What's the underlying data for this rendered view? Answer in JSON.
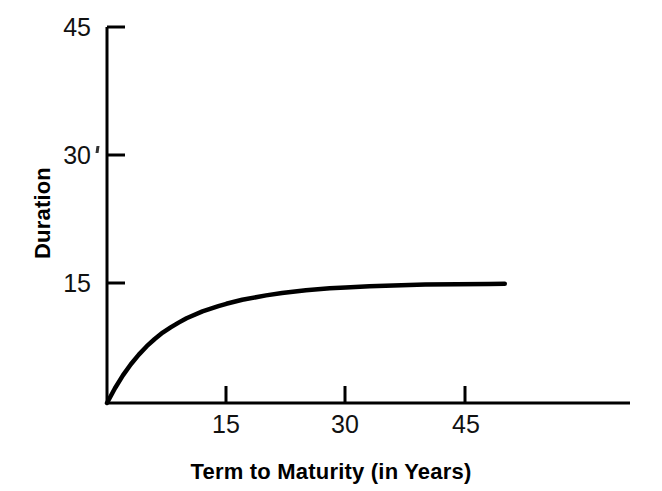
{
  "chart_data": {
    "type": "line",
    "title": "",
    "subtitle": "",
    "xlabel": "Term to Maturity (in Years)",
    "ylabel": "Duration",
    "xlim": [
      0,
      65
    ],
    "ylim": [
      0,
      47
    ],
    "xticks": [
      15,
      30,
      45
    ],
    "xtick_labels": [
      "15",
      "30",
      "45"
    ],
    "yticks": [
      15,
      30,
      45
    ],
    "ytick_labels": [
      "15",
      "30",
      "45"
    ],
    "grid": false,
    "legend": false,
    "legend_position": "none",
    "annotations": [],
    "series": [
      {
        "name": "Duration",
        "color": "#000000",
        "line_width": 4,
        "x": [
          0,
          1,
          2,
          3,
          4,
          5,
          6,
          7,
          8,
          9,
          10,
          12,
          14,
          15,
          17,
          20,
          22,
          25,
          28,
          30,
          33,
          36,
          40,
          44,
          48,
          50
        ],
        "values": [
          0.0,
          1.85,
          3.45,
          4.85,
          6.05,
          7.1,
          8.0,
          8.8,
          9.45,
          10.05,
          10.6,
          11.45,
          12.1,
          12.4,
          12.9,
          13.45,
          13.75,
          14.1,
          14.35,
          14.45,
          14.6,
          14.7,
          14.8,
          14.85,
          14.88,
          14.9
        ]
      }
    ]
  },
  "axis": {
    "y_title": "Duration",
    "x_title": "Term to Maturity (in Years)",
    "y_tick_45": "45",
    "y_tick_30": "30",
    "y_tick_15": "15",
    "x_tick_15": "15",
    "x_tick_30": "30",
    "x_tick_45": "45"
  },
  "style": {
    "background": "#ffffff",
    "ink": "#000000",
    "curve_color": "#000000"
  }
}
